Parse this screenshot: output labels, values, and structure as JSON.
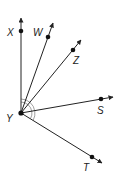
{
  "diagram": {
    "type": "rays-from-common-vertex",
    "vertex": {
      "label": "Y",
      "x": 21,
      "y": 113
    },
    "rays": [
      {
        "name": "X",
        "label": "X",
        "point": {
          "x": 21,
          "y": 31
        },
        "tip": {
          "x": 21,
          "y": 18
        },
        "label_pos": {
          "x": 7,
          "y": 36
        }
      },
      {
        "name": "W",
        "label": "W",
        "point": {
          "x": 48,
          "y": 37
        },
        "tip": {
          "x": 53,
          "y": 23
        },
        "label_pos": {
          "x": 33,
          "y": 36
        }
      },
      {
        "name": "Z",
        "label": "Z",
        "point": {
          "x": 73,
          "y": 50
        },
        "tip": {
          "x": 81,
          "y": 40
        },
        "label_pos": {
          "x": 73,
          "y": 64
        }
      },
      {
        "name": "S",
        "label": "S",
        "point": {
          "x": 101,
          "y": 99
        },
        "tip": {
          "x": 113,
          "y": 97
        },
        "label_pos": {
          "x": 97,
          "y": 114
        }
      },
      {
        "name": "T",
        "label": "T",
        "point": {
          "x": 92,
          "y": 157
        },
        "tip": {
          "x": 102,
          "y": 163
        },
        "label_pos": {
          "x": 83,
          "y": 171
        }
      }
    ],
    "angle_marks": "double arc at vertex Y",
    "line_color": "#222222"
  }
}
